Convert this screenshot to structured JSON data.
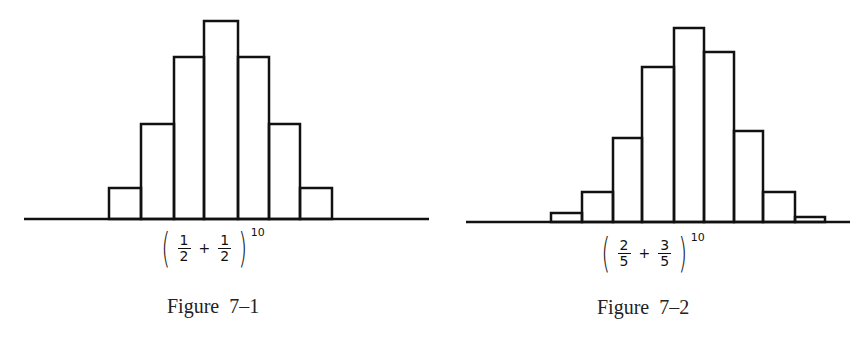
{
  "chart_data": [
    {
      "type": "bar",
      "title": "Figure 7–1",
      "formula": {
        "a_num": "1",
        "a_den": "2",
        "op": "+",
        "b_num": "1",
        "b_den": "2",
        "exponent": "10"
      },
      "description": "Binomial distribution (1/2 + 1/2)^10, histogram of central terms",
      "categories": [
        2,
        3,
        4,
        5,
        6,
        7,
        8
      ],
      "values": [
        45,
        120,
        210,
        252,
        210,
        120,
        45
      ],
      "xlabel": "",
      "ylabel": "",
      "grid": false,
      "axes": "baseline only, no ticks"
    },
    {
      "type": "bar",
      "title": "Figure 7–2",
      "formula": {
        "a_num": "2",
        "a_den": "5",
        "op": "+",
        "b_num": "3",
        "b_den": "5",
        "exponent": "10"
      },
      "description": "Binomial distribution (2/5 + 3/5)^10, histogram",
      "categories": [
        2,
        3,
        4,
        5,
        6,
        7,
        8,
        9,
        10
      ],
      "values": [
        0.0106,
        0.0425,
        0.1115,
        0.2007,
        0.2508,
        0.215,
        0.1209,
        0.0403,
        0.006
      ],
      "xlabel": "",
      "ylabel": "",
      "grid": false,
      "axes": "baseline only, no ticks"
    }
  ],
  "figures": [
    {
      "caption": "Figure  7–1",
      "formula": {
        "a_num": "1",
        "a_den": "2",
        "op": "+",
        "b_num": "1",
        "b_den": "2",
        "exponent": "10"
      },
      "baseline": {
        "x1": 24,
        "x2": 429,
        "y": 219
      },
      "bar_edges": [
        109,
        141,
        174,
        204,
        238,
        269,
        300,
        332
      ],
      "bar_tops": [
        188,
        124,
        57,
        21,
        57,
        124,
        188
      ]
    },
    {
      "caption": "Figure  7–2",
      "formula": {
        "a_num": "2",
        "a_den": "5",
        "op": "+",
        "b_num": "3",
        "b_den": "5",
        "exponent": "10"
      },
      "baseline": {
        "x1": 34,
        "x2": 418,
        "y": 222
      },
      "bar_edges": [
        119,
        150,
        181,
        210,
        242,
        272,
        302,
        331,
        363,
        393
      ],
      "bar_tops": [
        213,
        192,
        138,
        67,
        28,
        52,
        131,
        192,
        217
      ]
    }
  ],
  "colors": {
    "ink": "#111111",
    "background": "#ffffff"
  }
}
